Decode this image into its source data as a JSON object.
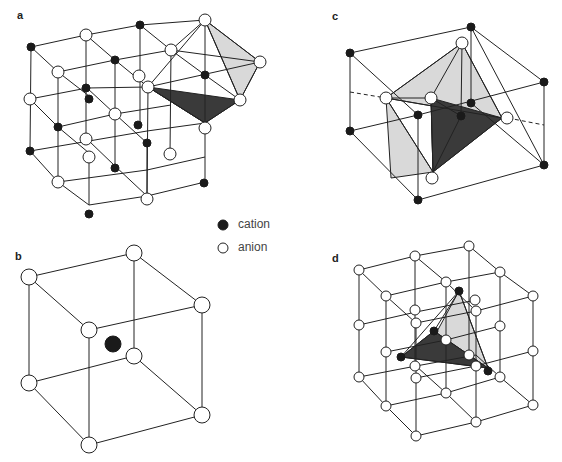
{
  "panels": {
    "a": {
      "label": "a",
      "description": "rock-salt lattice with octahedral and tetrahedral sites"
    },
    "b": {
      "label": "b",
      "description": "cube of 8 anions with central cation (cubic coordination)"
    },
    "c": {
      "label": "c",
      "description": "octahedral and tetrahedral coordination in cell"
    },
    "d": {
      "label": "d",
      "description": "anion lattice with tetrahedron of cations"
    }
  },
  "legend": {
    "cation": {
      "label": "cation",
      "color": "#1a1a1a"
    },
    "anion": {
      "label": "anion",
      "color": "#ffffff"
    }
  },
  "colors": {
    "dark_face": "#3a3a3a",
    "light_face": "#d9d9d9",
    "line": "#222222"
  }
}
